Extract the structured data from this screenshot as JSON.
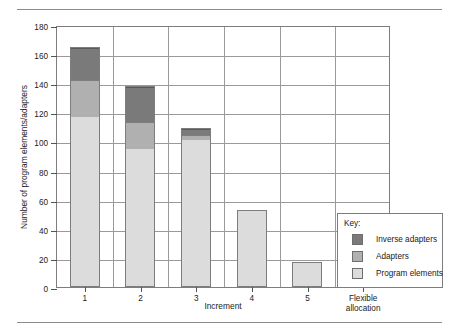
{
  "figure": {
    "top_rule": "horizontal-rule",
    "bottom_rule": "horizontal-rule"
  },
  "chart_data": {
    "type": "bar",
    "subtype": "stacked-vertical",
    "title": "",
    "xlabel": "Increment",
    "ylabel": "Number of program elements/adapters",
    "categories": [
      "1",
      "2",
      "3",
      "4",
      "5",
      "Flexible\nallocation"
    ],
    "ylim": [
      0,
      180
    ],
    "yticks": [
      0,
      20,
      40,
      60,
      80,
      100,
      120,
      140,
      160,
      180
    ],
    "ytick_labels": [
      "0",
      "20",
      "40",
      "60",
      "80",
      "100",
      "120",
      "140",
      "160",
      "180"
    ],
    "grid": true,
    "legend_position": "right-outside",
    "legend_title": "Key:",
    "series": [
      {
        "name": "Program elements",
        "color": "#dcdcdc",
        "values": [
          118,
          96,
          103,
          53,
          17,
          40
        ]
      },
      {
        "name": "Adapters",
        "color": "#b0b0b0",
        "values": [
          25,
          18.5,
          3,
          0,
          0,
          0
        ]
      },
      {
        "name": "Inverse adapters",
        "color": "#7a7a7a",
        "values": [
          22,
          23.5,
          3,
          0,
          0,
          0
        ]
      }
    ],
    "totals": [
      165,
      138,
      109,
      53,
      17,
      40
    ]
  },
  "legend": {
    "title": "Key:",
    "entries": [
      {
        "label": "Inverse adapters",
        "color": "#7a7a7a"
      },
      {
        "label": "Adapters",
        "color": "#b0b0b0"
      },
      {
        "label": "Program elements",
        "color": "#dcdcdc"
      }
    ]
  }
}
